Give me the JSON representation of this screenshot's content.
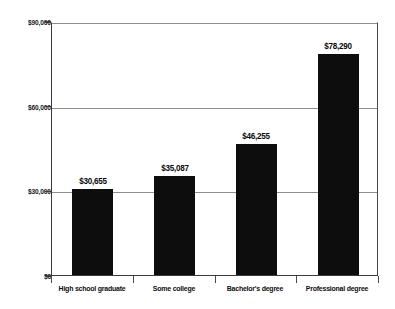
{
  "chart_data": {
    "type": "bar",
    "title": "",
    "subtitle": "",
    "xlabel": "",
    "ylabel": "",
    "categories": [
      "High school graduate",
      "Some college",
      "Bachelor's degree",
      "Professional degree"
    ],
    "values": [
      30655,
      35087,
      46255,
      78290
    ],
    "data_labels": [
      "$30,655",
      "$35,087",
      "$46,255",
      "$78,290"
    ],
    "ylim": [
      0,
      90000
    ],
    "ytick_values": [
      0,
      30000,
      60000,
      90000
    ],
    "ytick_labels": [
      "$0",
      "$30,000",
      "$60,000",
      "$90,000"
    ],
    "grid": true,
    "grid_axis": "y",
    "legend": false,
    "legend_position": "none",
    "bar_color": "#0d0d0d",
    "grid_color": "#8d8d8d",
    "axis_color": "#3a3a3a",
    "text_color": "#0d0d0d",
    "background": "#ffffff"
  }
}
